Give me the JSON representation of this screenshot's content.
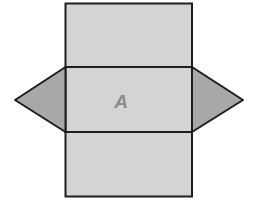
{
  "diagram": {
    "type": "triangular-prism-net",
    "label": "A",
    "colors": {
      "rect_fill": "#d4d4d4",
      "triangle_fill": "#a8a8a8",
      "stroke": "#1e1e1e",
      "label": "#8a8a8a",
      "background": "#ffffff"
    },
    "faces": [
      {
        "name": "top-rectangle",
        "shape": "rectangle"
      },
      {
        "name": "middle-rectangle",
        "shape": "rectangle",
        "label": "A"
      },
      {
        "name": "bottom-rectangle",
        "shape": "rectangle"
      },
      {
        "name": "left-triangle",
        "shape": "triangle"
      },
      {
        "name": "right-triangle",
        "shape": "triangle"
      }
    ]
  }
}
